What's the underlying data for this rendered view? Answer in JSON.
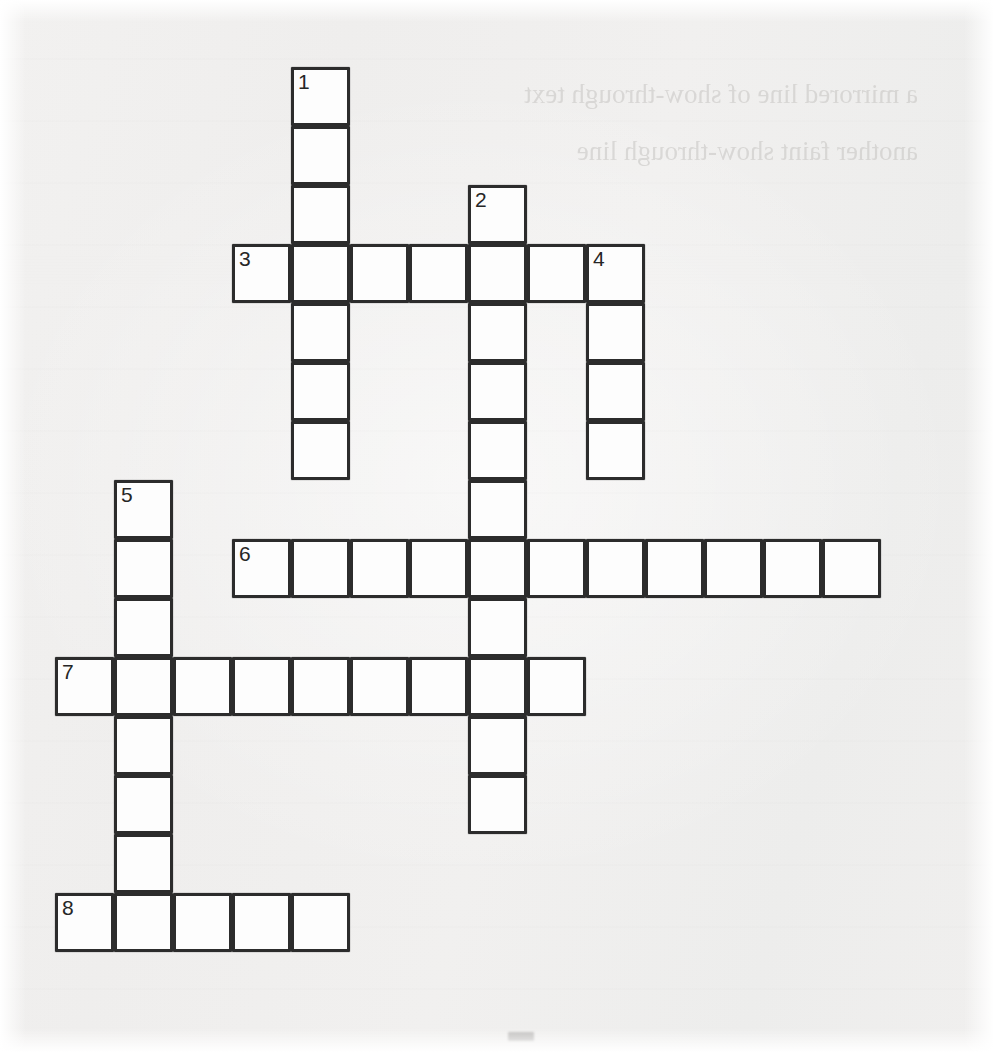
{
  "document": {
    "kind": "crossword-puzzle",
    "title": "",
    "bottom_mark": ""
  },
  "bleed_through": {
    "note": "faint mirrored show-through text from reverse side of the scanned page",
    "lines": [
      "a mirrored line of show-through text",
      "another faint show-through line"
    ]
  },
  "grid": {
    "cell_size": 59,
    "origin_x": 55,
    "origin_y": 67,
    "columns": 16,
    "rows": 16,
    "border_color": "#2c2c2c",
    "cell_fill": "#fdfdfd"
  },
  "clue_numbers": [
    "1",
    "2",
    "3",
    "4",
    "5",
    "6",
    "7",
    "8"
  ],
  "entries": [
    {
      "number": "1",
      "direction": "down",
      "length": 7,
      "start_col": 4,
      "start_row": 0
    },
    {
      "number": "2",
      "direction": "down",
      "length": 11,
      "start_col": 7,
      "start_row": 2
    },
    {
      "number": "3",
      "direction": "across",
      "length": 7,
      "start_col": 3,
      "start_row": 3
    },
    {
      "number": "4",
      "direction": "down",
      "length": 4,
      "start_col": 9,
      "start_row": 3
    },
    {
      "number": "5",
      "direction": "down",
      "length": 8,
      "start_col": 1,
      "start_row": 7
    },
    {
      "number": "6",
      "direction": "across",
      "length": 11,
      "start_col": 3,
      "start_row": 8
    },
    {
      "number": "7",
      "direction": "across",
      "length": 9,
      "start_col": 0,
      "start_row": 10
    },
    {
      "number": "8",
      "direction": "across",
      "length": 5,
      "start_col": 0,
      "start_row": 14
    }
  ],
  "cells": [
    {
      "col": 4,
      "row": 0,
      "number": "1",
      "letter": ""
    },
    {
      "col": 4,
      "row": 1,
      "number": "",
      "letter": ""
    },
    {
      "col": 4,
      "row": 2,
      "number": "",
      "letter": ""
    },
    {
      "col": 7,
      "row": 2,
      "number": "2",
      "letter": ""
    },
    {
      "col": 3,
      "row": 3,
      "number": "3",
      "letter": ""
    },
    {
      "col": 4,
      "row": 3,
      "number": "",
      "letter": ""
    },
    {
      "col": 5,
      "row": 3,
      "number": "",
      "letter": ""
    },
    {
      "col": 6,
      "row": 3,
      "number": "",
      "letter": ""
    },
    {
      "col": 7,
      "row": 3,
      "number": "",
      "letter": ""
    },
    {
      "col": 8,
      "row": 3,
      "number": "",
      "letter": ""
    },
    {
      "col": 9,
      "row": 3,
      "number": "4",
      "letter": ""
    },
    {
      "col": 4,
      "row": 4,
      "number": "",
      "letter": ""
    },
    {
      "col": 7,
      "row": 4,
      "number": "",
      "letter": ""
    },
    {
      "col": 9,
      "row": 4,
      "number": "",
      "letter": ""
    },
    {
      "col": 4,
      "row": 5,
      "number": "",
      "letter": ""
    },
    {
      "col": 7,
      "row": 5,
      "number": "",
      "letter": ""
    },
    {
      "col": 9,
      "row": 5,
      "number": "",
      "letter": ""
    },
    {
      "col": 4,
      "row": 6,
      "number": "",
      "letter": ""
    },
    {
      "col": 7,
      "row": 6,
      "number": "",
      "letter": ""
    },
    {
      "col": 9,
      "row": 6,
      "number": "",
      "letter": ""
    },
    {
      "col": 1,
      "row": 7,
      "number": "5",
      "letter": ""
    },
    {
      "col": 7,
      "row": 7,
      "number": "",
      "letter": ""
    },
    {
      "col": 1,
      "row": 8,
      "number": "",
      "letter": ""
    },
    {
      "col": 3,
      "row": 8,
      "number": "6",
      "letter": ""
    },
    {
      "col": 4,
      "row": 8,
      "number": "",
      "letter": ""
    },
    {
      "col": 5,
      "row": 8,
      "number": "",
      "letter": ""
    },
    {
      "col": 6,
      "row": 8,
      "number": "",
      "letter": ""
    },
    {
      "col": 7,
      "row": 8,
      "number": "",
      "letter": ""
    },
    {
      "col": 8,
      "row": 8,
      "number": "",
      "letter": ""
    },
    {
      "col": 9,
      "row": 8,
      "number": "",
      "letter": ""
    },
    {
      "col": 10,
      "row": 8,
      "number": "",
      "letter": ""
    },
    {
      "col": 11,
      "row": 8,
      "number": "",
      "letter": ""
    },
    {
      "col": 12,
      "row": 8,
      "number": "",
      "letter": ""
    },
    {
      "col": 13,
      "row": 8,
      "number": "",
      "letter": ""
    },
    {
      "col": 1,
      "row": 9,
      "number": "",
      "letter": ""
    },
    {
      "col": 7,
      "row": 9,
      "number": "",
      "letter": ""
    },
    {
      "col": 0,
      "row": 10,
      "number": "7",
      "letter": ""
    },
    {
      "col": 1,
      "row": 10,
      "number": "",
      "letter": ""
    },
    {
      "col": 2,
      "row": 10,
      "number": "",
      "letter": ""
    },
    {
      "col": 3,
      "row": 10,
      "number": "",
      "letter": ""
    },
    {
      "col": 4,
      "row": 10,
      "number": "",
      "letter": ""
    },
    {
      "col": 5,
      "row": 10,
      "number": "",
      "letter": ""
    },
    {
      "col": 6,
      "row": 10,
      "number": "",
      "letter": ""
    },
    {
      "col": 7,
      "row": 10,
      "number": "",
      "letter": ""
    },
    {
      "col": 8,
      "row": 10,
      "number": "",
      "letter": ""
    },
    {
      "col": 1,
      "row": 11,
      "number": "",
      "letter": ""
    },
    {
      "col": 7,
      "row": 11,
      "number": "",
      "letter": ""
    },
    {
      "col": 1,
      "row": 12,
      "number": "",
      "letter": ""
    },
    {
      "col": 7,
      "row": 12,
      "number": "",
      "letter": ""
    },
    {
      "col": 1,
      "row": 13,
      "number": "",
      "letter": ""
    },
    {
      "col": 0,
      "row": 14,
      "number": "8",
      "letter": ""
    },
    {
      "col": 1,
      "row": 14,
      "number": "",
      "letter": ""
    },
    {
      "col": 2,
      "row": 14,
      "number": "",
      "letter": ""
    },
    {
      "col": 3,
      "row": 14,
      "number": "",
      "letter": ""
    },
    {
      "col": 4,
      "row": 14,
      "number": "",
      "letter": ""
    }
  ]
}
